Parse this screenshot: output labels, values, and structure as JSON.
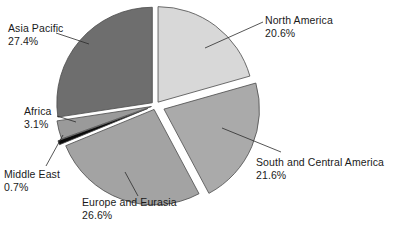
{
  "chart_data": {
    "type": "pie",
    "title": "",
    "subtitle": "",
    "xlabel": "",
    "ylabel": "",
    "legend_position": "none",
    "grid": false,
    "units": "percent",
    "start_angle_deg": 0,
    "direction": "clockwise",
    "exploded": true,
    "categories": [
      "North America",
      "South and Central America",
      "Europe and Eurasia",
      "Middle East",
      "Africa",
      "Asia Pacific"
    ],
    "values": [
      20.6,
      21.6,
      26.6,
      0.7,
      3.1,
      27.4
    ],
    "value_labels": [
      "20.6%",
      "21.6%",
      "26.6%",
      "0.7%",
      "3.1%",
      "27.4%"
    ],
    "colors": [
      "#d8d8d8",
      "#aaaaaa",
      "#a3a3a3",
      "#0a0a0a",
      "#9a9a9a",
      "#6e6e6e"
    ],
    "slices": [
      {
        "name": "North America",
        "value": 20.6,
        "value_label": "20.6%",
        "color": "#d8d8d8"
      },
      {
        "name": "South and Central America",
        "value": 21.6,
        "value_label": "21.6%",
        "color": "#aaaaaa"
      },
      {
        "name": "Europe and Eurasia",
        "value": 26.6,
        "value_label": "26.6%",
        "color": "#a3a3a3"
      },
      {
        "name": "Middle East",
        "value": 0.7,
        "value_label": "0.7%",
        "color": "#0a0a0a"
      },
      {
        "name": "Africa",
        "value": 3.1,
        "value_label": "3.1%",
        "color": "#9a9a9a"
      },
      {
        "name": "Asia Pacific",
        "value": 27.4,
        "value_label": "27.4%",
        "color": "#6e6e6e"
      }
    ]
  },
  "labels": {
    "north_america": {
      "name": "North America",
      "value": "20.6%"
    },
    "south_central_america": {
      "name": "South and Central America",
      "value": "21.6%"
    },
    "europe_eurasia": {
      "name": "Europe and Eurasia",
      "value": "26.6%"
    },
    "middle_east": {
      "name": "Middle East",
      "value": "0.7%"
    },
    "africa": {
      "name": "Africa",
      "value": "3.1%"
    },
    "asia_pacific": {
      "name": "Asia Pacific",
      "value": "27.4%"
    }
  },
  "style": {
    "background": "#ffffff",
    "outline_color": "#4a4a4a",
    "leader_line_color": "#2b2b2b",
    "text_color": "#1a1a1a"
  }
}
